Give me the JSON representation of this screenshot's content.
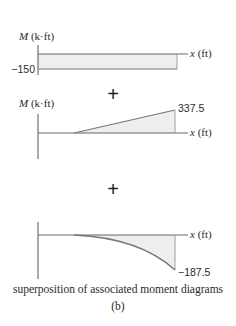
{
  "diagrams": [
    {
      "id": "constant-moment",
      "y_axis_label_M": "M",
      "y_axis_label_unit": " (k·ft)",
      "x_axis_label_x": "x",
      "x_axis_label_unit": " (ft)",
      "value_label": "−150",
      "shape": "rectangle",
      "value": -150
    },
    {
      "id": "linear-moment",
      "y_axis_label_M": "M",
      "y_axis_label_unit": " (k·ft)",
      "x_axis_label_x": "x",
      "x_axis_label_unit": " (ft)",
      "value_label": "337.5",
      "shape": "triangle",
      "value": 337.5
    },
    {
      "id": "parabolic-moment",
      "x_axis_label_x": "x",
      "x_axis_label_unit": " (ft)",
      "value_label": "−187.5",
      "shape": "parabola",
      "value": -187.5
    }
  ],
  "operators": [
    "+",
    "+"
  ],
  "caption": "superposition of associated moment diagrams",
  "sublabel": "(b)",
  "colors": {
    "fill": "#eeeeee",
    "line": "#6e6e6e",
    "axis": "#555555",
    "text": "#2a2a2a"
  }
}
